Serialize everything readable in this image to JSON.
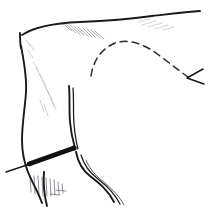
{
  "figure": {
    "background_color": "#ffffff",
    "ink_color": "#1a1a1a",
    "hatch_color": "#8d8d96",
    "width": 208,
    "height": 212
  },
  "elements": {
    "top_contour": {
      "name": "upper-edge-line",
      "path": "M 22 35 C 34 27, 56 23, 80 22 C 104 21, 130 19, 152 16 C 170 14, 186 12, 200 11"
    },
    "top_corner": {
      "name": "upper-left-corner",
      "path": "M 20 33 C 20 38, 20 43, 21 48"
    },
    "left_contour": {
      "name": "left-edge-line",
      "path": "M 21 46 C 24 62, 27 76, 26 92 C 25 108, 22 124, 22 140 C 22 152, 24 162, 28 172 C 32 182, 38 192, 42 203"
    },
    "inner_vertical": {
      "name": "inner-vertical-line",
      "path": "M 69 86 C 70 98, 69 110, 70 122 C 71 133, 73 141, 75 148"
    },
    "inner_vertical_second": {
      "name": "inner-vertical-line-secondary",
      "path": "M 73 88 C 74 100, 73 112, 74 124 C 75 135, 76 142, 78 149"
    },
    "lower_right_contour": {
      "name": "lower-right-edge-line",
      "path": "M 76 152 C 78 162, 82 170, 90 176 C 99 183, 108 190, 114 202"
    },
    "lower_right_secondary": {
      "name": "lower-right-edge-line-secondary",
      "path": "M 81 155 C 84 165, 90 173, 98 179 C 107 186, 115 194, 120 204"
    },
    "lower_right_hair": {
      "name": "lower-right-edge-line-hair",
      "path": "M 86 160 C 90 170, 97 177, 105 183 C 113 190, 120 197, 124 205"
    },
    "bottom_left_curve": {
      "name": "bottom-left-edge-line",
      "path": "M 44 172 C 43 184, 44 194, 47 206"
    },
    "dashed_arc": {
      "name": "dashed-reference-line",
      "path": "M 91 76 C 93 62, 100 50, 113 44 C 128 37, 146 45, 160 56 C 172 65, 181 72, 188 77",
      "style": "dot-dash"
    },
    "arrowhead": {
      "name": "arrowhead",
      "path": "M 203 69 L 187 78 L 204 84",
      "points_to": "right-end-of-dashed-line"
    },
    "pin_bar": {
      "name": "pin-bar",
      "path": "M 29 164 L 74 148",
      "thickness": 4.6
    },
    "pin_tail": {
      "name": "pin-tail-line",
      "path": "M 6 172 L 30 164"
    },
    "pin_tip": {
      "name": "pin-tip",
      "cx": 74,
      "cy": 148,
      "r": 2.6
    }
  },
  "hatching": {
    "upper_right_group": {
      "name": "upper-right-hatch-group",
      "strokes": [
        "M 72 31 L 62 23",
        "M 76 33 L 66 24",
        "M 80 34 L 70 25",
        "M 84 35 L 74 26",
        "M 88 36 L 78 27",
        "M 92 37 L 83 28",
        "M 96 38 L 87 29",
        "M 100 38 L 91 30",
        "M 104 39 L 95 31"
      ]
    },
    "top_faint_group": {
      "name": "top-faint-hatch-group",
      "strokes": [
        "M 138 22 L 150 19",
        "M 142 25 L 156 21",
        "M 148 27 L 162 23",
        "M 155 29 L 168 25",
        "M 163 30 L 174 27"
      ]
    },
    "left_inner_group": {
      "name": "left-inner-hatch-group",
      "strokes": [
        "M 38 70 L 33 62",
        "M 42 78 L 36 68",
        "M 46 86 L 39 74",
        "M 49 94 L 42 80",
        "M 52 100 L 45 86",
        "M 54 106 L 48 92",
        "M 56 110 L 51 98",
        "M 44 112 L 40 100",
        "M 48 116 L 44 104"
      ]
    },
    "upper_left_corner_group": {
      "name": "upper-left-corner-hatch-group",
      "strokes": [
        "M 30 46 L 26 40",
        "M 34 50 L 29 43",
        "M 33 58 L 28 50"
      ]
    },
    "bottom_group": {
      "name": "bottom-hatch-group",
      "strokes": [
        "M 30 176 L 31 192",
        "M 34 176 L 35 194",
        "M 38 176 L 39 195",
        "M 42 177 L 43 196",
        "M 46 178 L 47 196",
        "M 50 179 L 51 196",
        "M 54 180 L 55 195",
        "M 58 182 L 59 194",
        "M 62 184 L 63 193",
        "M 56 190 L 66 191",
        "M 50 194 L 60 195"
      ]
    }
  }
}
